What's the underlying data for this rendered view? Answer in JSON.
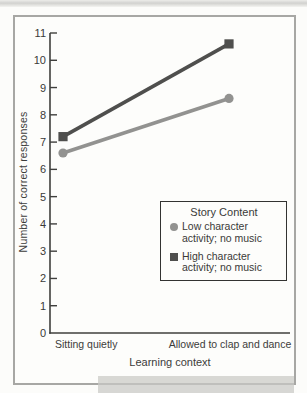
{
  "chart_data": {
    "type": "line",
    "title": "",
    "xlabel": "Learning context",
    "ylabel": "Number of correct responses",
    "categories": [
      "Sitting quietly",
      "Allowed to clap and dance"
    ],
    "series": [
      {
        "name": "Low character activity; no music",
        "marker": "circle",
        "color": "#929290",
        "values": [
          6.6,
          8.6
        ]
      },
      {
        "name": "High character activity; no music",
        "marker": "square",
        "color": "#4f4f4d",
        "values": [
          7.2,
          10.6
        ]
      }
    ],
    "ylim": [
      0,
      11
    ],
    "ytick_step": 1,
    "grid": false,
    "legend": {
      "title": "Story Content",
      "position": "inside-lower-right"
    }
  },
  "figure": {
    "frame_border_color": "#a7a7a4",
    "axis_color": "#3f3f3d",
    "background": "#fdfdfb"
  }
}
